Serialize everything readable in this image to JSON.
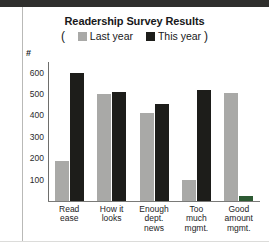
{
  "chart_data": {
    "type": "bar",
    "title": "Readership Survey Results",
    "xlabel": "",
    "ylabel": "#",
    "ylim": [
      0,
      650
    ],
    "yticks": [
      100,
      200,
      300,
      400,
      500,
      600
    ],
    "grid": false,
    "legend_position": "top-center",
    "legend_prefix": "(",
    "legend_suffix": ")",
    "categories": [
      "Read ease",
      "How it looks",
      "Enough dept. news",
      "Too much mgmt.",
      "Good amount mgmt."
    ],
    "category_lines": [
      [
        "Read",
        "ease"
      ],
      [
        "How it",
        "looks"
      ],
      [
        "Enough",
        "dept.",
        "news"
      ],
      [
        "Too",
        "much",
        "mgmt."
      ],
      [
        "Good",
        "amount",
        "mgmt."
      ]
    ],
    "series": [
      {
        "name": "Last year",
        "color": "#a9a9a7",
        "values": [
          185,
          500,
          410,
          100,
          505
        ]
      },
      {
        "name": "This year",
        "color": "#1d1d1a",
        "values": [
          600,
          510,
          455,
          520,
          25
        ]
      }
    ],
    "bar_overrides": {
      "this_year_last_bar_color": "#2d5a33"
    }
  },
  "colors": {
    "last_year": "#a9a9a7",
    "this_year": "#1d1d1a",
    "green_artifact": "#2d5a33",
    "axis": "#6e6e6c",
    "text": "#18181a",
    "page_background": "#ffffff"
  }
}
